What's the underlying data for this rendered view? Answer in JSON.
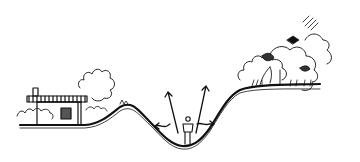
{
  "illustration": {
    "kind": "landscape-section-sketch",
    "description": "Pen sketch cross-section of a valley: a house with a deck on the left hill, a person standing at the valley bottom with arrows indicating sight lines, and trees on the right hill.",
    "elements": [
      "house",
      "left-shrubs",
      "left-tree",
      "valley-ground",
      "person",
      "view-arrows",
      "right-trees"
    ],
    "colors": {
      "ink": "#111111",
      "background": "#ffffff"
    }
  }
}
